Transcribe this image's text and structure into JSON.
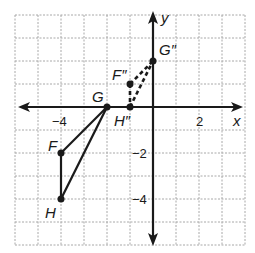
{
  "diagram": {
    "type": "coordinate-plane",
    "grid": {
      "x_min": -6,
      "x_max": 4,
      "y_min": -6,
      "y_max": 4,
      "step": 1
    },
    "axes": {
      "x_label": "x",
      "y_label": "y"
    },
    "ticks": {
      "x": [
        {
          "value": -4,
          "label": "−4"
        },
        {
          "value": 2,
          "label": "2"
        }
      ],
      "y": [
        {
          "value": -2,
          "label": "−2"
        },
        {
          "value": -4,
          "label": "−4"
        }
      ]
    },
    "original_triangle": {
      "style": "solid",
      "points": [
        {
          "name": "F",
          "x": -4,
          "y": -2
        },
        {
          "name": "G",
          "x": -2,
          "y": 0
        },
        {
          "name": "H",
          "x": -4,
          "y": -4
        }
      ]
    },
    "image_triangle": {
      "style": "dashed",
      "points": [
        {
          "name": "F″",
          "x": -1,
          "y": 1
        },
        {
          "name": "G″",
          "x": 0,
          "y": 2
        },
        {
          "name": "H″",
          "x": -1,
          "y": 0
        }
      ]
    },
    "colors": {
      "line": "#1a1a1a",
      "grid": "#a0a0a0",
      "background": "#ffffff"
    }
  }
}
